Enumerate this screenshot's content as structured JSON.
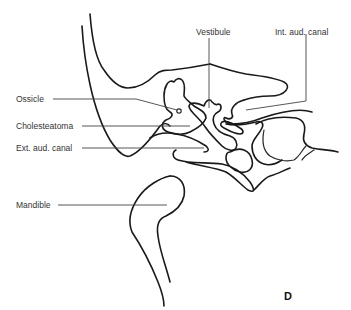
{
  "figure": {
    "panel_letter": "D",
    "labels": {
      "vestibule": "Vestibule",
      "int_aud_canal": "Int. aud. canal",
      "ossicle": "Ossicle",
      "cholesteatoma": "Cholesteatoma",
      "ext_aud_canal": "Ext. aud. canal",
      "mandible": "Mandible"
    },
    "colors": {
      "line": "#1a1a1a",
      "text": "#333333",
      "background": "#ffffff"
    }
  }
}
